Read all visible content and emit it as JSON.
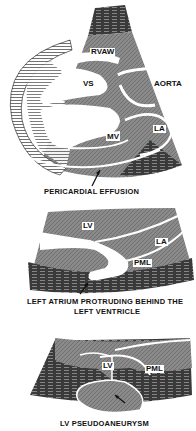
{
  "panels": [
    {
      "id": "pericardial-effusion",
      "labels": {
        "rvaw": "RVAW",
        "vs": "VS",
        "aorta": "AORTA",
        "mv": "MV",
        "la": "LA"
      },
      "caption": "PERICARDIAL EFFUSION"
    },
    {
      "id": "left-atrium-protruding",
      "labels": {
        "lv": "LV",
        "la": "LA",
        "pml": "PML"
      },
      "caption_line1": "LEFT ATRIUM PROTRUDING BEHIND THE",
      "caption_line2": "LEFT VENTRICLE"
    },
    {
      "id": "lv-pseudoaneurysm",
      "labels": {
        "lv": "LV",
        "pml": "PML"
      },
      "caption": "LV PSEUDOANEURYSM"
    }
  ],
  "colors": {
    "tissue": "#8a8a8a",
    "dark": "#2a2a2a",
    "line": "#ffffff"
  }
}
